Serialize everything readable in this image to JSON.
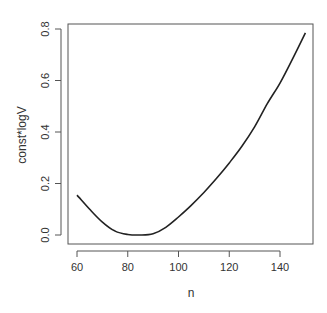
{
  "chart_data": {
    "type": "line",
    "title": "",
    "xlabel": "n",
    "ylabel": "const*logV",
    "xlim": [
      60,
      150
    ],
    "ylim": [
      0.0,
      0.8
    ],
    "grid": false,
    "legend": null,
    "x_ticks": [
      60,
      80,
      100,
      120,
      140
    ],
    "x_tick_labels": [
      "60",
      "80",
      "100",
      "120",
      "140"
    ],
    "y_ticks": [
      0.0,
      0.2,
      0.4,
      0.6,
      0.8
    ],
    "y_tick_labels": [
      "0.0",
      "0.2",
      "0.4",
      "0.6",
      "0.8"
    ],
    "series": [
      {
        "name": "const*logV",
        "color": "#222222",
        "x": [
          60,
          65,
          70,
          75,
          80,
          85,
          90,
          95,
          100,
          105,
          110,
          115,
          120,
          125,
          130,
          135,
          140,
          145,
          150
        ],
        "values": [
          0.155,
          0.1,
          0.05,
          0.015,
          0.002,
          0.0,
          0.005,
          0.03,
          0.07,
          0.115,
          0.165,
          0.22,
          0.28,
          0.345,
          0.42,
          0.51,
          0.59,
          0.685,
          0.785
        ]
      }
    ]
  }
}
